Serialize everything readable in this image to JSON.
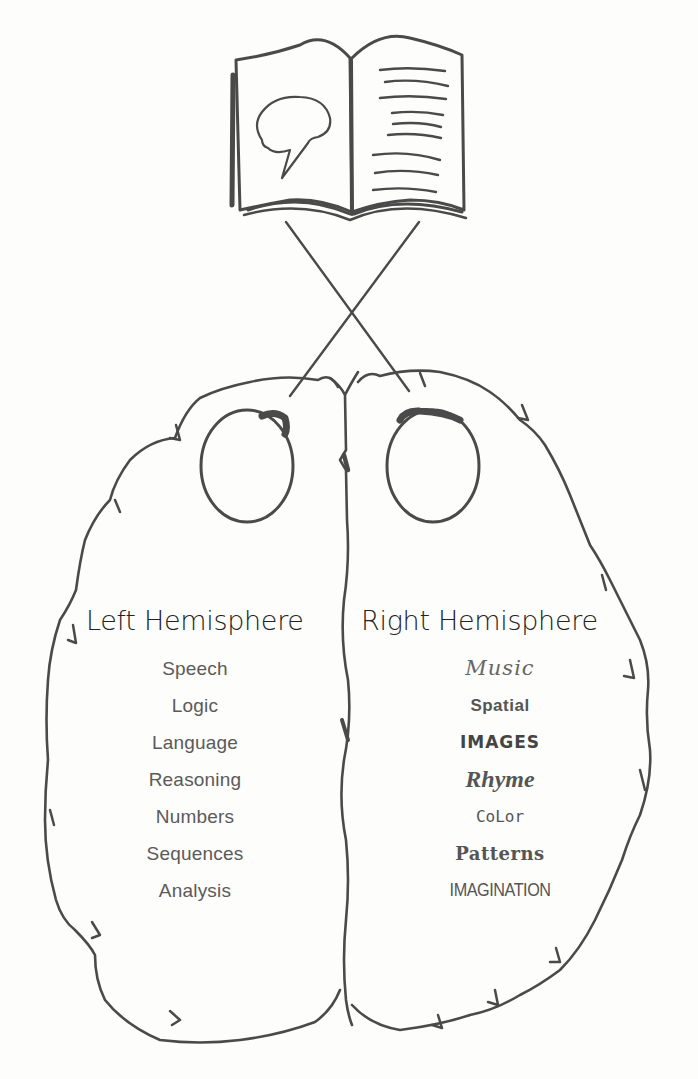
{
  "diagram": {
    "type": "hand-drawn illustration",
    "book": {
      "left_page_icon": "brain-speech-bubble-icon",
      "right_page_icon": "text-lines-icon",
      "right_page_line_count": 9
    },
    "left_hemisphere": {
      "title": "Left Hemisphere",
      "items": [
        "Speech",
        "Logic",
        "Language",
        "Reasoning",
        "Numbers",
        "Sequences",
        "Analysis"
      ]
    },
    "right_hemisphere": {
      "title": "Right Hemisphere",
      "items": [
        "Music",
        "Spatial",
        "IMAGES",
        "Rhyme",
        "CoLor",
        "Patterns",
        "IMAGINATION"
      ]
    },
    "colors": {
      "stroke": "#4a4a4a",
      "background": "#fdfdfb",
      "title_text": "#222222",
      "item_text": "#5a5a5a"
    }
  }
}
